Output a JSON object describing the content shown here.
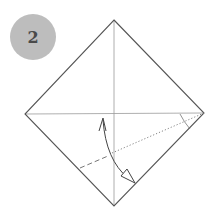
{
  "step": {
    "number": "2",
    "badge_color": "#bdbdbd",
    "text_color": "#4a4a4a"
  },
  "diagram": {
    "type": "origami-fold-step",
    "paper": {
      "shape": "square rotated 45deg",
      "top": [
        114,
        20
      ],
      "right": [
        204,
        113
      ],
      "bottom": [
        114,
        206
      ],
      "left": [
        25,
        114
      ],
      "stroke": "#555555"
    },
    "creases": [
      {
        "name": "vertical-diagonal-crease",
        "style": "solid-thin",
        "from": [
          114,
          20
        ],
        "to": [
          114,
          206
        ]
      },
      {
        "name": "horizontal-diagonal-crease",
        "style": "solid-thin",
        "from": [
          25,
          114
        ],
        "to": [
          204,
          113
        ]
      }
    ],
    "fold_lines": [
      {
        "name": "valley-fold-dashed",
        "style": "dashed",
        "from": [
          80,
          168
        ],
        "to": [
          108,
          156
        ]
      },
      {
        "name": "hidden-fold-dotted",
        "style": "dotted",
        "from": [
          112,
          153
        ],
        "to": [
          204,
          113
        ]
      }
    ],
    "angle_mark": {
      "at": [
        204,
        113
      ],
      "note": "angle bisector arc"
    },
    "arrow": {
      "name": "fold-arrow",
      "direction": "fold bottom-left edge up to horizontal crease and unfold",
      "start": [
        103,
        118
      ],
      "end": [
        135,
        183
      ]
    }
  }
}
